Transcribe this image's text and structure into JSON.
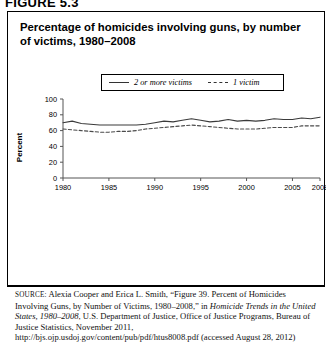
{
  "figure": {
    "label": "FIGURE 5.3",
    "title": "Percentage of homicides involving guns, by number of victims, 1980–2008"
  },
  "legend": {
    "position": "top-center",
    "entries": [
      {
        "label": "2 or more victims",
        "style": "solid"
      },
      {
        "label": "1 victim",
        "style": "dashed"
      }
    ]
  },
  "axes": {
    "ylabel": "Percent",
    "yticks": [
      "0",
      "20",
      "40",
      "60",
      "80",
      "100"
    ],
    "xticks": [
      "1980",
      "1985",
      "1990",
      "1995",
      "2000",
      "2005",
      "2008"
    ]
  },
  "source": {
    "prefix": "SOURCE:",
    "part1": " Alexia Cooper and Erica L. Smith, “Figure 39. Percent of Homicides Involving Guns, by Number of Victims, 1980–2008,” in ",
    "italic": "Homicide Trends in the United States, 1980–2008",
    "part2": ", U.S. Department of Justice, Office of Justice Programs, Bureau of Justice Statistics, November 2011, http://bjs.ojp.usdoj.gov/content/pub/pdf/htus8008.pdf (accessed August 28, 2012)"
  },
  "colors": {
    "line_two_or_more": "#3a3a3a",
    "line_one_victim": "#4a4a4a",
    "axis": "#555555",
    "border": "#000000",
    "background": "#ffffff"
  },
  "chart_data": {
    "type": "line",
    "title": "Percentage of homicides involving guns, by number of victims, 1980–2008",
    "xlabel": "",
    "ylabel": "Percent",
    "ylim": [
      0,
      100
    ],
    "xlim": [
      1980,
      2008
    ],
    "grid": false,
    "legend_position": "top-center",
    "x": [
      1980,
      1981,
      1982,
      1983,
      1984,
      1985,
      1986,
      1987,
      1988,
      1989,
      1990,
      1991,
      1992,
      1993,
      1994,
      1995,
      1996,
      1997,
      1998,
      1999,
      2000,
      2001,
      2002,
      2003,
      2004,
      2005,
      2006,
      2007,
      2008
    ],
    "series": [
      {
        "name": "2 or more victims",
        "style": "solid",
        "values": [
          70,
          72,
          69,
          68,
          67,
          67,
          67,
          67,
          67,
          68,
          70,
          72,
          71,
          73,
          75,
          73,
          71,
          72,
          74,
          72,
          73,
          72,
          73,
          75,
          74,
          74,
          76,
          75,
          77
        ]
      },
      {
        "name": "1 victim",
        "style": "dashed",
        "values": [
          62,
          61,
          60,
          59,
          58,
          58,
          59,
          59,
          60,
          62,
          63,
          64,
          65,
          66,
          67,
          66,
          65,
          64,
          63,
          62,
          62,
          62,
          63,
          64,
          64,
          64,
          66,
          66,
          66
        ]
      }
    ]
  }
}
